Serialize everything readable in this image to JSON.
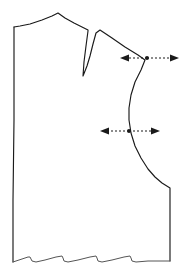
{
  "figure": {
    "type": "sewing-pattern-diagram",
    "background_color": "#ffffff",
    "outline_color": "#1a1a1a",
    "hem_color": "#555555",
    "canvas": {
      "width": 186,
      "height": 275
    }
  },
  "pattern_piece": {
    "name": "bodice-front-block",
    "outline_path": "M 14 27 L 20 26 L 30 24 L 42 20 L 52 16 L 58 13 L 65 18 L 74 23 L 82 27 L 88 30 L 88 31 L 86 46 L 84 62 L 83 76 L 87 66 L 90 56 L 93 44 L 96 33 L 100 30 L 112 38 L 125 47 L 138 55 L 145 60 L 141 70 L 135 82 L 131 95 L 129 108 L 129 120 L 131 133 L 135 146 L 141 158 L 148 169 L 155 177 L 162 183 L 170 188 L 170 200 L 170 225 L 170 261",
    "left_edge_path": "M 14 27 L 14 120 L 13 200 L 13 262",
    "hem_path": "M 13 262 L 22 259 L 28 257 L 30 257 L 31 259 L 32 261 L 36 262 L 45 260 L 56 257 L 62 256 L 63 258 L 64 261 L 68 262 L 78 260 L 90 257 L 96 256 L 97 258 L 98 261 L 102 262 L 112 260 L 124 257 L 130 256 L 131 258 L 132 261 L 136 262 L 148 261 L 160 261 L 170 261",
    "notch_positions": [
      30,
      63,
      97,
      130
    ],
    "notch_count": 4
  },
  "markers": [
    {
      "id": "shoulder-armhole-marker",
      "label": "armhole-top-adjustment-arrow",
      "center_x": 147,
      "center_y": 58,
      "left_tip_x": 120,
      "right_tip_x": 179,
      "direction": "bidirectional-outward"
    },
    {
      "id": "armhole-depth-marker",
      "label": "armhole-width-adjustment-arrow",
      "center_x": 129,
      "center_y": 131,
      "left_tip_x": 100,
      "right_tip_x": 160,
      "direction": "bidirectional-outward"
    }
  ]
}
